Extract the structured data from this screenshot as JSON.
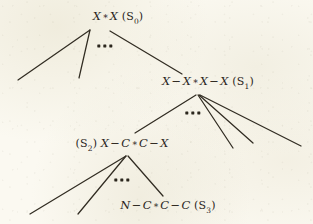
{
  "figure": {
    "name": "grammar-derivation-tree",
    "background_color": "#faf8ef",
    "ink_color": "#2b261d",
    "width": 313,
    "height": 224
  },
  "nodes": [
    {
      "id": "s0",
      "tag": "S",
      "subscript": "0",
      "tag_position": "after",
      "expression": "X * X",
      "tokens": [
        {
          "kind": "sym",
          "text": "X"
        },
        {
          "kind": "star",
          "text": "∗"
        },
        {
          "kind": "sym",
          "text": "X"
        }
      ],
      "label_text": "X * X (S0)",
      "x": 118,
      "y": 17
    },
    {
      "id": "s1",
      "tag": "S",
      "subscript": "1",
      "tag_position": "after",
      "expression": "X - X * X - X",
      "tokens": [
        {
          "kind": "sym",
          "text": "X"
        },
        {
          "kind": "op",
          "text": "−"
        },
        {
          "kind": "sym",
          "text": "X"
        },
        {
          "kind": "star",
          "text": "∗"
        },
        {
          "kind": "sym",
          "text": "X"
        },
        {
          "kind": "op",
          "text": "−"
        },
        {
          "kind": "sym",
          "text": "X"
        }
      ],
      "label_text": "X - X * X - X (S1)",
      "x": 208,
      "y": 82
    },
    {
      "id": "s2",
      "tag": "S",
      "subscript": "2",
      "tag_position": "before",
      "expression": "X - C * C - X",
      "tokens": [
        {
          "kind": "sym",
          "text": "X"
        },
        {
          "kind": "op",
          "text": "−"
        },
        {
          "kind": "sym",
          "text": "C"
        },
        {
          "kind": "star",
          "text": "∗"
        },
        {
          "kind": "sym",
          "text": "C"
        },
        {
          "kind": "op",
          "text": "−"
        },
        {
          "kind": "sym",
          "text": "X"
        }
      ],
      "label_text": "(S2) X - C * C - X",
      "x": 122,
      "y": 144
    },
    {
      "id": "s3",
      "tag": "S",
      "subscript": "3",
      "tag_position": "after",
      "expression": "N - C * C - C",
      "tokens": [
        {
          "kind": "sym",
          "text": "N"
        },
        {
          "kind": "op",
          "text": "−"
        },
        {
          "kind": "sym",
          "text": "C"
        },
        {
          "kind": "star",
          "text": "∗"
        },
        {
          "kind": "sym",
          "text": "C"
        },
        {
          "kind": "op",
          "text": "−"
        },
        {
          "kind": "sym",
          "text": "C"
        }
      ],
      "label_text": "N - C * C - C (S3)",
      "x": 168,
      "y": 206
    }
  ],
  "ellipses": [
    {
      "id": "ellipsis-s0",
      "dots": 3,
      "x": 105,
      "y": 46
    },
    {
      "id": "ellipsis-s1",
      "dots": 3,
      "x": 193,
      "y": 113
    },
    {
      "id": "ellipsis-s2",
      "dots": 3,
      "x": 122,
      "y": 180
    }
  ],
  "edges": [
    {
      "id": "s0-child-1",
      "parent": "s0",
      "x1": 90,
      "y1": 30,
      "x2": 18,
      "y2": 80
    },
    {
      "id": "s0-child-2",
      "parent": "s0",
      "x1": 90,
      "y1": 30,
      "x2": 79,
      "y2": 78
    },
    {
      "id": "s0-child-3",
      "parent": "s0",
      "x1": 110,
      "y1": 31,
      "x2": 182,
      "y2": 74
    },
    {
      "id": "s1-child-1",
      "parent": "s1",
      "x1": 196,
      "y1": 95,
      "x2": 135,
      "y2": 133
    },
    {
      "id": "s1-child-2",
      "parent": "s1",
      "x1": 198,
      "y1": 95,
      "x2": 233,
      "y2": 148
    },
    {
      "id": "s1-child-3",
      "parent": "s1",
      "x1": 199,
      "y1": 95,
      "x2": 253,
      "y2": 143
    },
    {
      "id": "s1-child-4",
      "parent": "s1",
      "x1": 200,
      "y1": 95,
      "x2": 301,
      "y2": 146
    },
    {
      "id": "s2-child-1",
      "parent": "s2",
      "x1": 126,
      "y1": 156,
      "x2": 30,
      "y2": 214
    },
    {
      "id": "s2-child-2",
      "parent": "s2",
      "x1": 126,
      "y1": 156,
      "x2": 78,
      "y2": 214
    },
    {
      "id": "s2-child-3",
      "parent": "s2",
      "x1": 128,
      "y1": 156,
      "x2": 163,
      "y2": 196
    }
  ]
}
